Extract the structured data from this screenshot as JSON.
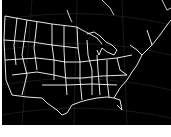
{
  "map": {
    "title": "",
    "region": "continental-united-states",
    "style": {
      "background": "#000000",
      "border_color": "#ffffff",
      "grid_color": "#3a3a3a",
      "page_background": "#ffffff"
    }
  }
}
